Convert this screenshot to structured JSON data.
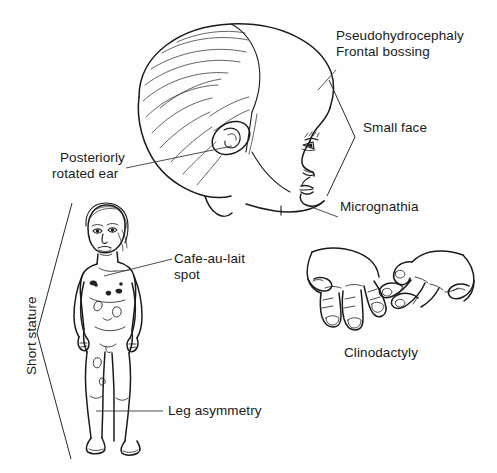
{
  "figure": {
    "background_color": "#fefefe",
    "ink_color": "#1b1b1b",
    "width": 497,
    "height": 473
  },
  "labels": {
    "pseudohydrocephaly": "Pseudohydrocephaly",
    "frontal_bossing": "Frontal bossing",
    "small_face": "Small face",
    "micrognathia": "Micrognathia",
    "posteriorly": "Posteriorly",
    "rotated_ear": "rotated ear",
    "cafe_au_lait": "Cafe-au-lait",
    "spot": "spot",
    "short_stature": "Short stature",
    "leg_asymmetry": "Leg asymmetry",
    "clinodactyly": "Clinodactyly"
  },
  "panels": {
    "head": {
      "name": "infant head profile",
      "features": [
        "enlarged cranium",
        "frontal bossing",
        "small face",
        "posteriorly rotated ear",
        "micrognathia"
      ]
    },
    "body": {
      "name": "standing child figure",
      "features": [
        "short stature",
        "cafe-au-lait spots",
        "leg asymmetry"
      ]
    },
    "hands": {
      "name": "pair of hands",
      "features": [
        "clinodactyly",
        "incurved fifth fingers"
      ]
    }
  }
}
